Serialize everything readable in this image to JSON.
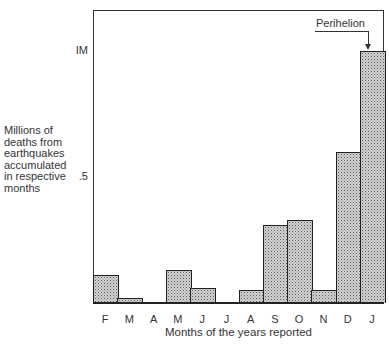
{
  "chart_data": {
    "type": "bar",
    "title": "",
    "xlabel": "Months of the years reported",
    "ylabel": "Millions of deaths from earthquakes accumulated in respective months",
    "ylabel_lines": [
      "Millions of",
      "deaths from",
      "earthquakes",
      "accumulated",
      "in respective",
      "months"
    ],
    "categories": [
      "F",
      "M",
      "A",
      "M",
      "J",
      "J",
      "A",
      "S",
      "O",
      "N",
      "D",
      "J"
    ],
    "values": [
      0.11,
      0.02,
      0.0,
      0.13,
      0.06,
      0.0,
      0.05,
      0.31,
      0.33,
      0.05,
      0.6,
      1.0
    ],
    "yticks": [
      {
        "value": 1.0,
        "label": "IM"
      },
      {
        "value": 0.5,
        "label": ".5"
      }
    ],
    "ylim": [
      0,
      1.0
    ],
    "grid": false,
    "legend": null,
    "annotations": [
      {
        "text": "Perihelion",
        "target_category_index": 11,
        "arrow": true
      }
    ],
    "style": {
      "fill": "stippled gray",
      "edge": "#222222"
    }
  }
}
